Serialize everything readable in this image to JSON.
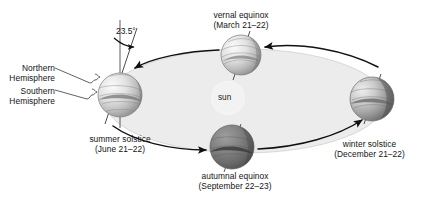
{
  "figure": {
    "title_alt": "Earth's orbit around the sun showing solstices and equinoxes",
    "background_color": "#ffffff",
    "orbit_fill": "#ececec",
    "orbit_stroke": "#1a1a1a"
  },
  "sun": {
    "label": "sun",
    "cx": 228,
    "cy": 98,
    "r": 17,
    "glow_color": "#f2f2f2"
  },
  "axis_tilt": {
    "label": "23.5°",
    "value": 23.5,
    "unit": "degrees"
  },
  "hemisphere_labels": [
    {
      "line1": "Northern",
      "line2": "Hemisphere"
    },
    {
      "line1": "Southern",
      "line2": "Hemisphere"
    }
  ],
  "positions": [
    {
      "id": "summer-solstice",
      "name": "summer solstice",
      "date": "(June 21–22)",
      "cx": 120,
      "cy": 95,
      "r": 22,
      "lit_side": "left",
      "shade": "light"
    },
    {
      "id": "vernal-equinox",
      "name": "vernal equinox",
      "date": "(March 21–22)",
      "cx": 241,
      "cy": 55,
      "r": 20,
      "lit_side": "top",
      "shade": "light"
    },
    {
      "id": "autumnal-equinox",
      "name": "autumnal equinox",
      "date": "(September 22–23)",
      "cx": 232,
      "cy": 147,
      "r": 22,
      "lit_side": "top",
      "shade": "dark"
    },
    {
      "id": "winter-solstice",
      "name": "winter solstice",
      "date": "(December 21–22)",
      "cx": 372,
      "cy": 99,
      "r": 22,
      "lit_side": "left",
      "shade": "medium"
    }
  ],
  "orbit": {
    "direction": "counterclockwise",
    "cx": 245,
    "cy": 101,
    "rx": 140,
    "ry": 52,
    "arrow_count": 4
  }
}
